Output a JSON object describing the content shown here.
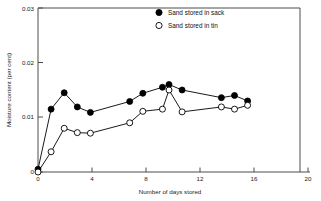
{
  "chart_data": {
    "type": "line",
    "title": "",
    "subtitle": "",
    "xlabel": "Number of days stored",
    "ylabel": "Moisture content (per cent)",
    "xlim": [
      0,
      20
    ],
    "ylim": [
      0,
      0.03
    ],
    "xticks": [
      "0",
      "4",
      "8",
      "12",
      "16",
      "20"
    ],
    "xtick_values": [
      0,
      4,
      8,
      12,
      16,
      20
    ],
    "yticks": [
      "0",
      "0.01",
      "0.02",
      "0.03"
    ],
    "ytick_values": [
      0,
      0.01,
      0.02,
      0.03
    ],
    "grid": false,
    "legend_position": "top-center",
    "series": [
      {
        "name": "Sand stored in sack",
        "marker": "filled-circle",
        "color": "#000000",
        "x": [
          0,
          1,
          2,
          3,
          4,
          7,
          8,
          9.5,
          10,
          11,
          14,
          15,
          16
        ],
        "values": [
          0.0005,
          0.0115,
          0.0145,
          0.0119,
          0.0109,
          0.0129,
          0.0144,
          0.0155,
          0.016,
          0.015,
          0.0136,
          0.014,
          0.013
        ]
      },
      {
        "name": "Sand stored in tin",
        "marker": "open-circle",
        "color": "#000000",
        "x": [
          0,
          1,
          2,
          3,
          4,
          7,
          8,
          9.5,
          10,
          11,
          14,
          15,
          16
        ],
        "values": [
          0.0,
          0.0037,
          0.008,
          0.0072,
          0.0071,
          0.009,
          0.0111,
          0.0115,
          0.015,
          0.011,
          0.0119,
          0.0115,
          0.0122
        ]
      }
    ],
    "legend_entries": [
      {
        "label": "Sand stored in sack",
        "marker": "filled-circle"
      },
      {
        "label": "Sand stored in tin",
        "marker": "open-circle"
      }
    ]
  }
}
